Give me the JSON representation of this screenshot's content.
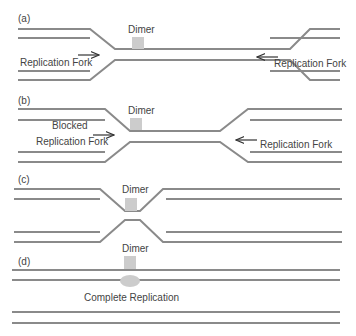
{
  "colors": {
    "strand": "#8a8a8a",
    "dimer": "#cccccc",
    "text": "#444444",
    "arrow": "#333333"
  },
  "panels": {
    "a": {
      "tag": "(a)",
      "dimer": "Dimer",
      "fork_left": "Replication Fork",
      "fork_right": "Replication Fork"
    },
    "b": {
      "tag": "(b)",
      "dimer": "Dimer",
      "fork_left_1": "Blocked",
      "fork_left_2": "Replication Fork",
      "fork_right": "Replication Fork"
    },
    "c": {
      "tag": "(c)",
      "dimer": "Dimer"
    },
    "d": {
      "tag": "(d)",
      "dimer": "Dimer",
      "caption": "Complete Replication"
    }
  }
}
